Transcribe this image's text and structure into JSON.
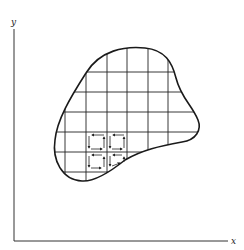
{
  "diagram": {
    "axes": {
      "x_label": "x",
      "y_label": "y"
    },
    "colors": {
      "ink": "#222222",
      "background": "#ffffff"
    },
    "grid": {
      "vertical_lines_x": [
        65,
        86,
        107,
        127,
        148,
        168
      ],
      "horizontal_lines_y": [
        72,
        92,
        112,
        132,
        152,
        172
      ]
    },
    "highlighted_cells": [
      {
        "col": 1,
        "row": 3,
        "circulation": "counterclockwise"
      },
      {
        "col": 2,
        "row": 3,
        "circulation": "counterclockwise"
      },
      {
        "col": 1,
        "row": 4,
        "circulation": "counterclockwise"
      },
      {
        "col": 2,
        "row": 4,
        "circulation": "counterclockwise"
      }
    ]
  }
}
